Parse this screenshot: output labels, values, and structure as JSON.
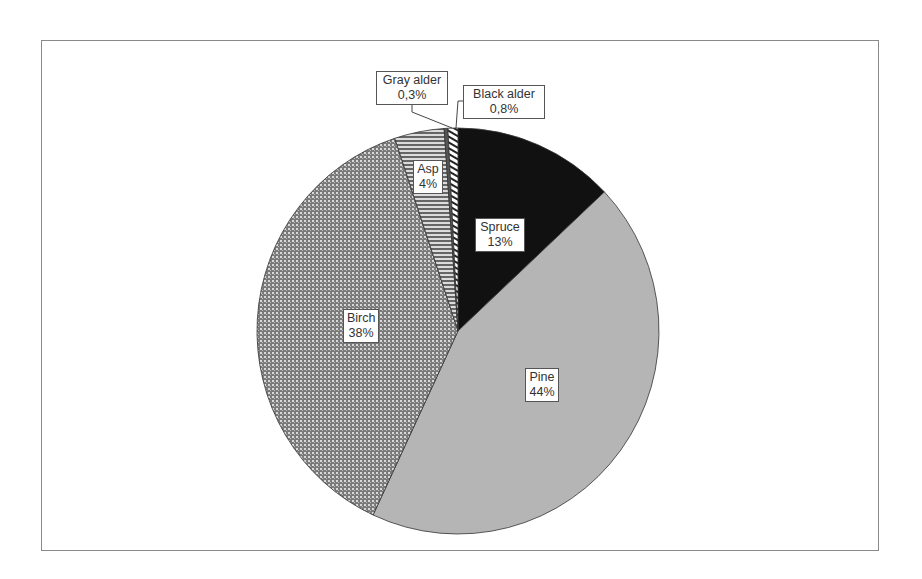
{
  "chart_data": {
    "type": "pie",
    "title": "",
    "start_angle_deg": 0,
    "direction": "clockwise",
    "slices": [
      {
        "name": "Spruce",
        "value": 13,
        "label": "13%",
        "fill": "#111111",
        "pattern": "solid-black"
      },
      {
        "name": "Pine",
        "value": 44,
        "label": "44%",
        "fill": "#b3b3b3",
        "pattern": "solid-gray"
      },
      {
        "name": "Birch",
        "value": 38,
        "label": "38%",
        "fill": "#8c8c8c",
        "pattern": "dotted"
      },
      {
        "name": "Asp",
        "value": 4,
        "label": "4%",
        "fill": "#888888",
        "pattern": "horizontal-stripes"
      },
      {
        "name": "Gray alder",
        "value": 0.3,
        "label": "0,3%",
        "fill": "#666666",
        "pattern": "dark-gray"
      },
      {
        "name": "Black alder",
        "value": 0.8,
        "label": "0,8%",
        "fill": "#ffffff",
        "pattern": "diagonal-stripes"
      }
    ],
    "categories": [
      "Spruce",
      "Pine",
      "Birch",
      "Asp",
      "Gray alder",
      "Black alder"
    ],
    "values": [
      13,
      44,
      38,
      4,
      0.3,
      0.8
    ],
    "legend": "none",
    "data_labels": "inside/callout"
  },
  "labels": {
    "spruce": {
      "name": "Spruce",
      "pct": "13%"
    },
    "pine": {
      "name": "Pine",
      "pct": "44%"
    },
    "birch": {
      "name": "Birch",
      "pct": "38%"
    },
    "asp": {
      "name": "Asp",
      "pct": "4%"
    },
    "gray_alder": {
      "name": "Gray alder",
      "pct": "0,3%"
    },
    "black_alder": {
      "name": "Black alder",
      "pct": "0,8%"
    }
  }
}
